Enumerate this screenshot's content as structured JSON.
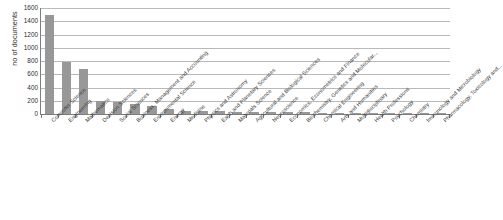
{
  "chart_data": {
    "type": "bar",
    "title": "",
    "subtitle": "",
    "xlabel": "",
    "ylabel": "no of documents",
    "ylim": [
      0,
      1600
    ],
    "yticks": [
      0,
      200,
      400,
      600,
      800,
      1000,
      1200,
      1400,
      1600
    ],
    "ytick_labels": [
      "0",
      "200",
      "400",
      "600",
      "800",
      "1000",
      "1200",
      "1400",
      "1600"
    ],
    "grid": true,
    "legend": false,
    "legend_position": "none",
    "bar_color": "#989898",
    "gridline_color": "#b9b9b9",
    "axis_color": "#7d7d7d",
    "categories": [
      "Computer Science",
      "Engineering",
      "Mathematics",
      "Decision Sciences",
      "Social Sciences",
      "Business, Management and Accounting",
      "Environmental Science",
      "Energy",
      "Medicine",
      "Physics and Astronomy",
      "Earth and Planetary Sciences",
      "Materials Science",
      "Agricultural and Biological Sciences",
      "Neuroscience",
      "Economics, Econometrics and Finance",
      "Biochemistry, Genetics and Molecular...",
      "Chemical Engineering",
      "Arts and Humanities",
      "Multidisciplinary",
      "Health Professions",
      "Psychology",
      "Chemistry",
      "Immunology and Microbiology",
      "Pharmacology, Toxicology and..."
    ],
    "values": [
      1500,
      780,
      680,
      195,
      185,
      150,
      120,
      75,
      52,
      40,
      38,
      35,
      32,
      30,
      28,
      25,
      22,
      20,
      18,
      16,
      14,
      12,
      10,
      8
    ]
  }
}
